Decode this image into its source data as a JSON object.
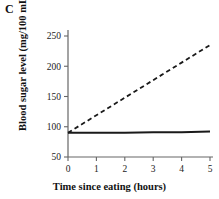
{
  "panel": {
    "label": "C"
  },
  "chart_data": {
    "type": "line",
    "title": "",
    "xlabel": "Time since eating (hours)",
    "ylabel": "Blood sugar level (mg/100 mL)",
    "xlim": [
      0,
      5
    ],
    "ylim": [
      50,
      250
    ],
    "xticks": [
      "0",
      "1",
      "2",
      "3",
      "4",
      "5"
    ],
    "yticks": [
      "50",
      "100",
      "150",
      "200",
      "250"
    ],
    "grid": false,
    "legend": "none",
    "x": [
      0,
      1,
      2,
      3,
      4,
      5
    ],
    "series": [
      {
        "name": "normal",
        "style": "solid",
        "color": "#1a1a1a",
        "values": [
          90,
          90,
          90,
          91,
          91,
          92
        ]
      },
      {
        "name": "diabetic",
        "style": "dashed",
        "color": "#1a1a1a",
        "values": [
          90,
          119,
          148,
          177,
          206,
          235
        ]
      }
    ]
  },
  "axis": {
    "line_color": "#555555"
  }
}
